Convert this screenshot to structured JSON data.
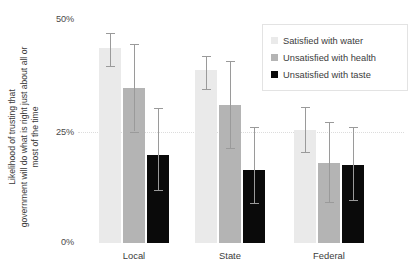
{
  "chart_data": {
    "type": "bar",
    "title": "",
    "subtitle": "",
    "xlabel": "",
    "ylabel_lines": [
      "Likelihood of trusting that",
      "government will do what is right just about all or",
      "most of the time"
    ],
    "categories": [
      "Local",
      "State",
      "Federal"
    ],
    "ytick_labels": [
      "50%",
      "25%",
      "0%"
    ],
    "ytick_values": [
      50,
      25,
      0
    ],
    "ylim": [
      0,
      50
    ],
    "grid": "horizontal-dotted-at-25",
    "legend_position": "top-right",
    "series": [
      {
        "name": "Satisfied with water",
        "color": "#eaeaea",
        "values": [
          43.7,
          38.8,
          25.3
        ],
        "err_low": [
          39.6,
          34.5,
          20.4
        ],
        "err_high": [
          47.1,
          41.9,
          30.5
        ]
      },
      {
        "name": "Unsatisfied with health",
        "color": "#b4b4b4",
        "values": [
          34.8,
          31.0,
          18.0
        ],
        "err_low": [
          25.0,
          21.3,
          9.2
        ],
        "err_high": [
          44.6,
          40.9,
          27.1
        ]
      },
      {
        "name": "Unsatisfied with taste",
        "color": "#0a0a0a",
        "values": [
          19.7,
          16.4,
          17.5
        ],
        "err_low": [
          11.9,
          9.0,
          9.6
        ],
        "err_high": [
          30.3,
          26.0,
          26.0
        ]
      }
    ]
  },
  "axis": {
    "y_title_line_1": "Likelihood of trusting that",
    "y_title_line_2": "government will do what is right just about all or",
    "y_title_line_3": "most of the time",
    "ytick_50": "50%",
    "ytick_25": "25%",
    "ytick_0": "0%",
    "xtick_local": "Local",
    "xtick_state": "State",
    "xtick_federal": "Federal"
  },
  "legend": {
    "items": [
      {
        "label": "Satisfied with water"
      },
      {
        "label": "Unsatisfied with health"
      },
      {
        "label": "Unsatisfied with taste"
      }
    ]
  }
}
